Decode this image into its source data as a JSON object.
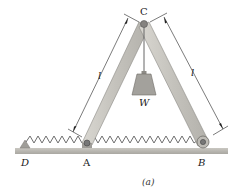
{
  "figure": {
    "caption": "(a)",
    "labels": {
      "C": "C",
      "W": "W",
      "D": "D",
      "A": "A",
      "B": "B",
      "length_left": "l",
      "length_right": "l"
    },
    "components": {
      "members": [
        "AC",
        "BC"
      ],
      "load": "W",
      "spring": "D-A-B",
      "supports": {
        "D": "fixed-pin",
        "A": "pin",
        "B": "roller"
      }
    },
    "colors": {
      "member_fill": "#c8c6c0",
      "member_edge": "#8a8883",
      "ground": "#b9b7b1",
      "weight": "#9d9b96",
      "spring": "#707070",
      "line": "#222222"
    }
  }
}
